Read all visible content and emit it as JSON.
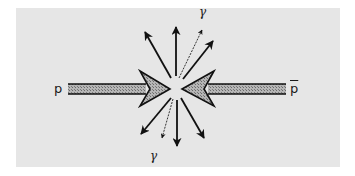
{
  "diagram": {
    "colors": {
      "background": "#e6e6e6",
      "ink": "#111111",
      "beam_fill": "#a8a8a8"
    },
    "beams": [
      {
        "id": "proton",
        "label": "p",
        "direction": "right"
      },
      {
        "id": "antiproton",
        "label": "p",
        "overline": true,
        "direction": "left"
      }
    ],
    "labels": {
      "proton": "p",
      "antiproton": "p",
      "gamma_top": "γ",
      "gamma_bottom": "γ"
    },
    "outgoing_tracks": {
      "solid_up": 3,
      "solid_down": 3,
      "photon_up": 1,
      "photon_down": 1
    }
  }
}
